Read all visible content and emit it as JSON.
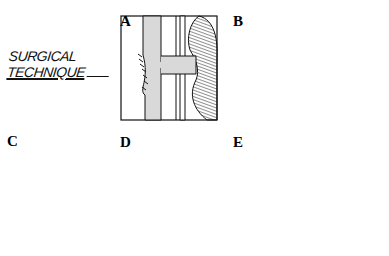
{
  "title": {
    "line1": "SURGICAL",
    "line2": "TECHNIQUE"
  },
  "panels": [
    {
      "label": "A",
      "description": "ureters with cross connection, kidney at right, sutured anastomosis on left ureter"
    },
    {
      "label": "B",
      "description": "divided ureter segments with kidney attached to bridging segment"
    },
    {
      "label": "C",
      "description": "anastomosis of upper segment, lower segment stump"
    },
    {
      "label": "D",
      "description": "kidney with clamped vessel pedicle and ligated ureter"
    },
    {
      "label": "E",
      "description": "kidney rotated with crossing vessels and ureter segments"
    }
  ],
  "colors": {
    "ink": "#111111",
    "fill": "#d9d9d9",
    "background": "#ffffff"
  }
}
